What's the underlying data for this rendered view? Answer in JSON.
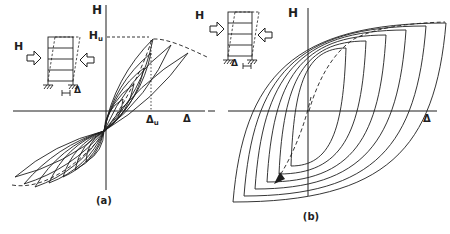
{
  "colors": {
    "background": "#ffffff",
    "line": "#1f1f1f"
  },
  "panel_a": {
    "caption": "(a)",
    "vertical_axis_label": "H",
    "horizontal_axis_label": "Δ",
    "peak_load_label": {
      "base": "H",
      "sub": "u"
    },
    "peak_displacement_label": {
      "base": "Δ",
      "sub": "u"
    },
    "icon": {
      "force_label": "H",
      "displacement_label": "Δ"
    }
  },
  "panel_b": {
    "caption": "(b)",
    "vertical_axis_label": "H",
    "horizontal_axis_label": "Δ",
    "icon": {
      "force_label": "H",
      "displacement_label": "Δ"
    }
  },
  "curves": {
    "panel_a": {
      "center": [
        104,
        131
      ],
      "upper_petals": [
        [
          123,
          99,
          5
        ],
        [
          134,
          84,
          6
        ],
        [
          144,
          68,
          7
        ],
        [
          151,
          53,
          8
        ],
        [
          153,
          39,
          8
        ],
        [
          171,
          45,
          7
        ],
        [
          188,
          53,
          6
        ]
      ],
      "lower_petals": [
        [
          86,
          162,
          5
        ],
        [
          75,
          170,
          6
        ],
        [
          63,
          177,
          7
        ],
        [
          49,
          183,
          8
        ],
        [
          35,
          187,
          8
        ],
        [
          24,
          184,
          7
        ],
        [
          15,
          177,
          6
        ]
      ],
      "envelope": "M 12 185 C 46 191 82 160 101 137 C 120 112 141 74 152 39 C 167 38 188 48 207 57"
    },
    "panel_b": {
      "loops": [
        {
          "bottom_tip": [
            291,
            166
          ],
          "top_tip": [
            346,
            48
          ]
        },
        {
          "bottom_tip": [
            279,
            174
          ],
          "top_tip": [
            366,
            41
          ]
        },
        {
          "bottom_tip": [
            267,
            182
          ],
          "top_tip": [
            386,
            35
          ]
        },
        {
          "bottom_tip": [
            255,
            189
          ],
          "top_tip": [
            406,
            30
          ]
        },
        {
          "bottom_tip": [
            244,
            196
          ],
          "top_tip": [
            426,
            26
          ]
        },
        {
          "bottom_tip": [
            233,
            202
          ],
          "top_tip": [
            446,
            23
          ]
        }
      ],
      "backbone_positive": "M 309 111 C 317 83 331 54 354 39 C 377 27 411 23 445 22",
      "backbone_negative": "M 311 97 C 306 120 295 153 277 180",
      "arrowhead_points": "274,184 280,172 285,179"
    }
  }
}
